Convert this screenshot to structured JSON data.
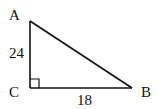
{
  "diagram": {
    "type": "right-triangle",
    "vertices": {
      "A": {
        "label": "A"
      },
      "B": {
        "label": "B"
      },
      "C": {
        "label": "C",
        "right_angle": true
      }
    },
    "sides": {
      "AC": {
        "label": "24"
      },
      "CB": {
        "label": "18"
      },
      "AB": {
        "label": ""
      }
    },
    "stroke_color": "#111111"
  }
}
